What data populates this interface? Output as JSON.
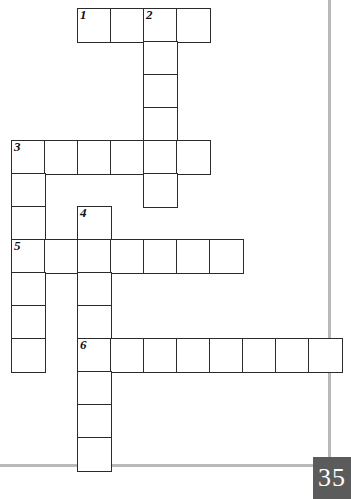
{
  "page": {
    "number_label": "35",
    "background_color": "#ffffff",
    "badge_color": "#5b5b5b",
    "rule_color": "#b9b9b9",
    "grid_line_color": "#2b2b2b"
  },
  "rules": [
    {
      "name": "right-margin-rule",
      "orientation": "vertical",
      "x": 328,
      "y": 0,
      "w": 3,
      "h": 466
    },
    {
      "name": "bottom-margin-rule",
      "orientation": "horizontal",
      "x": 0,
      "y": 464,
      "w": 331,
      "h": 3
    }
  ],
  "crossword": {
    "cell_size": 33,
    "origin_x": 11,
    "origin_y": 8,
    "entries": [
      {
        "number": "1",
        "direction": "across",
        "row": 0,
        "col": 2,
        "length": 4
      },
      {
        "number": "2",
        "direction": "down",
        "row": 0,
        "col": 4,
        "length": 6
      },
      {
        "number": "3",
        "direction": "across",
        "row": 4,
        "col": 0,
        "length": 6
      },
      {
        "number": "3",
        "direction": "down",
        "row": 4,
        "col": 0,
        "length": 7
      },
      {
        "number": "4",
        "direction": "down",
        "row": 6,
        "col": 2,
        "length": 8
      },
      {
        "number": "5",
        "direction": "across",
        "row": 7,
        "col": 0,
        "length": 7
      },
      {
        "number": "6",
        "direction": "across",
        "row": 10,
        "col": 2,
        "length": 8
      }
    ],
    "cells": [
      {
        "row": 0,
        "col": 2,
        "number": "1"
      },
      {
        "row": 0,
        "col": 3,
        "number": ""
      },
      {
        "row": 0,
        "col": 4,
        "number": "2"
      },
      {
        "row": 0,
        "col": 5,
        "number": ""
      },
      {
        "row": 1,
        "col": 4,
        "number": ""
      },
      {
        "row": 2,
        "col": 4,
        "number": ""
      },
      {
        "row": 3,
        "col": 4,
        "number": ""
      },
      {
        "row": 4,
        "col": 0,
        "number": "3"
      },
      {
        "row": 4,
        "col": 1,
        "number": ""
      },
      {
        "row": 4,
        "col": 2,
        "number": ""
      },
      {
        "row": 4,
        "col": 3,
        "number": ""
      },
      {
        "row": 4,
        "col": 4,
        "number": ""
      },
      {
        "row": 4,
        "col": 5,
        "number": ""
      },
      {
        "row": 5,
        "col": 0,
        "number": ""
      },
      {
        "row": 5,
        "col": 4,
        "number": ""
      },
      {
        "row": 6,
        "col": 0,
        "number": ""
      },
      {
        "row": 6,
        "col": 2,
        "number": "4"
      },
      {
        "row": 7,
        "col": 0,
        "number": "5"
      },
      {
        "row": 7,
        "col": 1,
        "number": ""
      },
      {
        "row": 7,
        "col": 2,
        "number": ""
      },
      {
        "row": 7,
        "col": 3,
        "number": ""
      },
      {
        "row": 7,
        "col": 4,
        "number": ""
      },
      {
        "row": 7,
        "col": 5,
        "number": ""
      },
      {
        "row": 7,
        "col": 6,
        "number": ""
      },
      {
        "row": 8,
        "col": 0,
        "number": ""
      },
      {
        "row": 8,
        "col": 2,
        "number": ""
      },
      {
        "row": 9,
        "col": 0,
        "number": ""
      },
      {
        "row": 9,
        "col": 2,
        "number": ""
      },
      {
        "row": 10,
        "col": 0,
        "number": ""
      },
      {
        "row": 10,
        "col": 2,
        "number": "6"
      },
      {
        "row": 10,
        "col": 3,
        "number": ""
      },
      {
        "row": 10,
        "col": 4,
        "number": ""
      },
      {
        "row": 10,
        "col": 5,
        "number": ""
      },
      {
        "row": 10,
        "col": 6,
        "number": ""
      },
      {
        "row": 10,
        "col": 7,
        "number": ""
      },
      {
        "row": 10,
        "col": 8,
        "number": ""
      },
      {
        "row": 10,
        "col": 9,
        "number": ""
      },
      {
        "row": 11,
        "col": 2,
        "number": ""
      },
      {
        "row": 12,
        "col": 2,
        "number": ""
      },
      {
        "row": 13,
        "col": 2,
        "number": ""
      }
    ]
  }
}
